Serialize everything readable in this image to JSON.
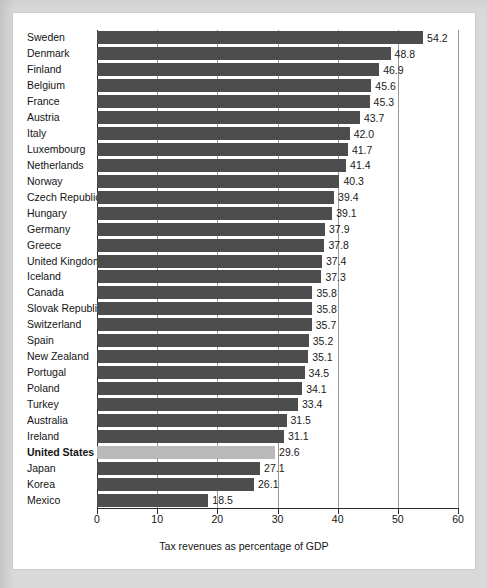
{
  "chart_data": {
    "type": "bar",
    "orientation": "horizontal",
    "title": "",
    "xlabel": "Tax revenues as percentage of GDP",
    "ylabel": "",
    "xlim": [
      0,
      60
    ],
    "xticks": [
      0,
      10,
      20,
      30,
      40,
      50,
      60
    ],
    "xtick_labels": [
      "0",
      "10",
      "20",
      "30",
      "40",
      "50",
      "60"
    ],
    "grid": "vertical",
    "legend": "none",
    "bar_color": "#4d4d4d",
    "highlight_color": "#b9b9b9",
    "highlight_category": "United States",
    "categories": [
      "Sweden",
      "Denmark",
      "Finland",
      "Belgium",
      "France",
      "Austria",
      "Italy",
      "Luxembourg",
      "Netherlands",
      "Norway",
      "Czech Republic",
      "Hungary",
      "Germany",
      "Greece",
      "United Kingdom",
      "Iceland",
      "Canada",
      "Slovak Republic",
      "Switzerland",
      "Spain",
      "New Zealand",
      "Portugal",
      "Poland",
      "Turkey",
      "Australia",
      "Ireland",
      "United States",
      "Japan",
      "Korea",
      "Mexico"
    ],
    "values": [
      54.2,
      48.8,
      46.9,
      45.6,
      45.3,
      43.7,
      42.0,
      41.7,
      41.4,
      40.3,
      39.4,
      39.1,
      37.9,
      37.8,
      37.4,
      37.3,
      35.8,
      35.8,
      35.7,
      35.2,
      35.1,
      34.5,
      34.1,
      33.4,
      31.5,
      31.1,
      29.6,
      27.1,
      26.1,
      18.5
    ],
    "value_labels": [
      "54.2",
      "48.8",
      "46.9",
      "45.6",
      "45.3",
      "43.7",
      "42.0",
      "41.7",
      "41.4",
      "40.3",
      "39.4",
      "39.1",
      "37.9",
      "37.8",
      "37.4",
      "37.3",
      "35.8",
      "35.8",
      "35.7",
      "35.2",
      "35.1",
      "34.5",
      "34.1",
      "33.4",
      "31.5",
      "31.1",
      "29.6",
      "27.1",
      "26.1",
      "18.5"
    ]
  },
  "page": {
    "background_color": "#d9d9d9",
    "card_color": "#ffffff",
    "caption_partial": ""
  }
}
